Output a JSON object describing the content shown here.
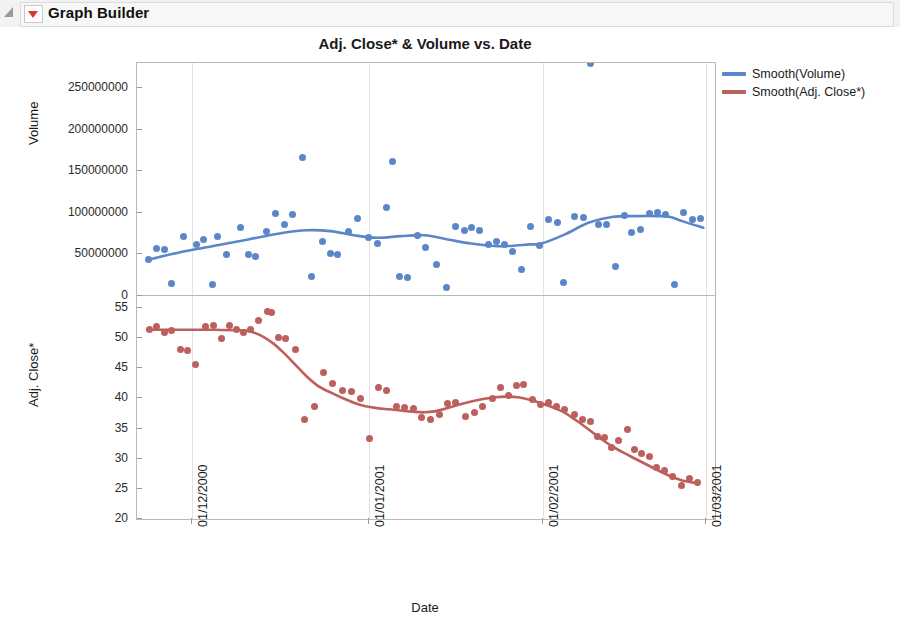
{
  "window": {
    "title": "Graph Builder",
    "disclosure_icon": "triangle-collapse-icon",
    "menu_icon": "red-dropdown-icon"
  },
  "chart_data": {
    "type": "scatter",
    "title": "Adj. Close* & Volume vs. Date",
    "xlabel": "Date",
    "grid": true,
    "legend_position": "right",
    "panels": [
      {
        "name": "volume",
        "ylabel": "Volume",
        "ylim": [
          0,
          280000000
        ],
        "yticks": [
          0,
          50000000,
          100000000,
          150000000,
          200000000,
          250000000
        ],
        "ytick_labels": [
          "0",
          "50000000",
          "100000000",
          "150000000",
          "200000000",
          "250000000"
        ],
        "point_color": "#5b87c9",
        "line_color": "#5b87c9",
        "series_name": "Volume",
        "smooth_name": "Smooth(Volume)",
        "points": [
          [
            0.5,
            44000000
          ],
          [
            1.2,
            57000000
          ],
          [
            1.8,
            56000000
          ],
          [
            2.4,
            15000000
          ],
          [
            3.5,
            72000000
          ],
          [
            4.6,
            62000000
          ],
          [
            5.2,
            68000000
          ],
          [
            5.9,
            14000000
          ],
          [
            6.4,
            72000000
          ],
          [
            7.1,
            50000000
          ],
          [
            8.3,
            82000000
          ],
          [
            9.0,
            50000000
          ],
          [
            9.6,
            47000000
          ],
          [
            10.5,
            77000000
          ],
          [
            11.3,
            99000000
          ],
          [
            12.1,
            86000000
          ],
          [
            12.8,
            98000000
          ],
          [
            13.6,
            167000000
          ],
          [
            14.4,
            23000000
          ],
          [
            15.3,
            66000000
          ],
          [
            16.0,
            51000000
          ],
          [
            16.6,
            50000000
          ],
          [
            17.5,
            78000000
          ],
          [
            18.3,
            93000000
          ],
          [
            19.2,
            70000000
          ],
          [
            20.0,
            63000000
          ],
          [
            20.8,
            107000000
          ],
          [
            21.3,
            162000000
          ],
          [
            21.9,
            24000000
          ],
          [
            22.6,
            22000000
          ],
          [
            23.4,
            73000000
          ],
          [
            24.1,
            58000000
          ],
          [
            25.0,
            38000000
          ],
          [
            25.9,
            10000000
          ],
          [
            26.7,
            83000000
          ],
          [
            27.4,
            79000000
          ],
          [
            28.0,
            82000000
          ],
          [
            28.7,
            79000000
          ],
          [
            29.5,
            62000000
          ],
          [
            30.2,
            66000000
          ],
          [
            30.8,
            62000000
          ],
          [
            31.5,
            54000000
          ],
          [
            32.3,
            32000000
          ],
          [
            33.1,
            84000000
          ],
          [
            33.8,
            61000000
          ],
          [
            34.6,
            92000000
          ],
          [
            35.4,
            88000000
          ],
          [
            35.9,
            16000000
          ],
          [
            36.8,
            95000000
          ],
          [
            37.6,
            94000000
          ],
          [
            38.2,
            280000000
          ],
          [
            38.9,
            86000000
          ],
          [
            39.5,
            86000000
          ],
          [
            40.3,
            36000000
          ],
          [
            41.1,
            97000000
          ],
          [
            41.7,
            76000000
          ],
          [
            42.4,
            80000000
          ],
          [
            43.2,
            99000000
          ],
          [
            43.9,
            101000000
          ],
          [
            44.6,
            98000000
          ],
          [
            45.3,
            14000000
          ],
          [
            46.1,
            100000000
          ],
          [
            46.9,
            92000000
          ],
          [
            47.6,
            93000000
          ]
        ],
        "smooth": [
          [
            0.3,
            43000000
          ],
          [
            3,
            52000000
          ],
          [
            6,
            60000000
          ],
          [
            9,
            68000000
          ],
          [
            12,
            76000000
          ],
          [
            14,
            79000000
          ],
          [
            16,
            78000000
          ],
          [
            18,
            73000000
          ],
          [
            20,
            70000000
          ],
          [
            22,
            72000000
          ],
          [
            24,
            73000000
          ],
          [
            26,
            68000000
          ],
          [
            28,
            63000000
          ],
          [
            30,
            60000000
          ],
          [
            31,
            60000000
          ],
          [
            33,
            62000000
          ],
          [
            34,
            63000000
          ],
          [
            36,
            74000000
          ],
          [
            38,
            88000000
          ],
          [
            40,
            95000000
          ],
          [
            42,
            96000000
          ],
          [
            44,
            96000000
          ],
          [
            45,
            95000000
          ],
          [
            46,
            90000000
          ],
          [
            47.8,
            82000000
          ]
        ]
      },
      {
        "name": "adj_close",
        "ylabel": "Adj. Close*",
        "ylim": [
          20,
          57
        ],
        "yticks": [
          20,
          25,
          30,
          35,
          40,
          45,
          50,
          55
        ],
        "ytick_labels": [
          "20",
          "25",
          "30",
          "35",
          "40",
          "45",
          "50",
          "55"
        ],
        "point_color": "#bd5f5c",
        "line_color": "#bd5f5c",
        "series_name": "Adj. Close*",
        "smooth_name": "Smooth(Adj. Close*)",
        "points": [
          [
            0.6,
            51.4
          ],
          [
            1.2,
            51.9
          ],
          [
            1.8,
            51.0
          ],
          [
            2.4,
            51.3
          ],
          [
            3.2,
            48.1
          ],
          [
            3.8,
            47.9
          ],
          [
            4.5,
            45.6
          ],
          [
            5.3,
            51.9
          ],
          [
            6.0,
            52.1
          ],
          [
            6.7,
            50.0
          ],
          [
            7.4,
            52.1
          ],
          [
            8.0,
            51.5
          ],
          [
            8.6,
            50.9
          ],
          [
            9.2,
            51.5
          ],
          [
            9.9,
            53.0
          ],
          [
            10.6,
            54.5
          ],
          [
            11.0,
            54.3
          ],
          [
            11.6,
            50.2
          ],
          [
            12.2,
            50.0
          ],
          [
            13.0,
            48.1
          ],
          [
            13.8,
            36.5
          ],
          [
            14.6,
            38.7
          ],
          [
            15.4,
            44.3
          ],
          [
            16.2,
            42.5
          ],
          [
            17.0,
            41.4
          ],
          [
            17.8,
            41.1
          ],
          [
            18.6,
            40.0
          ],
          [
            19.3,
            33.4
          ],
          [
            20.1,
            41.8
          ],
          [
            20.8,
            41.4
          ],
          [
            21.6,
            38.7
          ],
          [
            22.3,
            38.5
          ],
          [
            23.1,
            38.4
          ],
          [
            23.8,
            36.8
          ],
          [
            24.5,
            36.6
          ],
          [
            25.3,
            37.3
          ],
          [
            26.0,
            39.1
          ],
          [
            26.7,
            39.4
          ],
          [
            27.5,
            37.0
          ],
          [
            28.3,
            37.6
          ],
          [
            29.0,
            38.6
          ],
          [
            29.8,
            40.0
          ],
          [
            30.5,
            41.9
          ],
          [
            31.2,
            40.5
          ],
          [
            31.9,
            42.2
          ],
          [
            32.5,
            42.4
          ],
          [
            33.2,
            39.9
          ],
          [
            33.9,
            39.0
          ],
          [
            34.6,
            39.4
          ],
          [
            35.3,
            38.6
          ],
          [
            36.0,
            38.2
          ],
          [
            36.8,
            37.4
          ],
          [
            37.5,
            36.6
          ],
          [
            38.2,
            36.2
          ],
          [
            38.8,
            33.7
          ],
          [
            39.4,
            33.5
          ],
          [
            40.0,
            31.9
          ],
          [
            40.6,
            33.0
          ],
          [
            41.3,
            34.8
          ],
          [
            41.9,
            31.5
          ],
          [
            42.5,
            30.9
          ],
          [
            43.2,
            30.3
          ],
          [
            43.8,
            28.5
          ],
          [
            44.5,
            28.0
          ],
          [
            45.2,
            27.0
          ],
          [
            45.9,
            25.6
          ],
          [
            46.6,
            26.8
          ],
          [
            47.3,
            26.0
          ]
        ],
        "smooth": [
          [
            0.4,
            51.4
          ],
          [
            3,
            51.4
          ],
          [
            6,
            51.4
          ],
          [
            8,
            51.3
          ],
          [
            9,
            51.2
          ],
          [
            10,
            50.5
          ],
          [
            11,
            49.3
          ],
          [
            12,
            47.6
          ],
          [
            13,
            45.6
          ],
          [
            14,
            43.6
          ],
          [
            15,
            42.0
          ],
          [
            16,
            41.0
          ],
          [
            17,
            40.1
          ],
          [
            18,
            39.3
          ],
          [
            19,
            38.7
          ],
          [
            20,
            38.4
          ],
          [
            21,
            38.2
          ],
          [
            22,
            38.0
          ],
          [
            23,
            37.8
          ],
          [
            24,
            37.7
          ],
          [
            25,
            37.9
          ],
          [
            26,
            38.4
          ],
          [
            27,
            39.0
          ],
          [
            28,
            39.5
          ],
          [
            29,
            39.9
          ],
          [
            30,
            40.2
          ],
          [
            31,
            40.3
          ],
          [
            32,
            40.2
          ],
          [
            33,
            39.8
          ],
          [
            34,
            39.2
          ],
          [
            35,
            38.5
          ],
          [
            36,
            37.6
          ],
          [
            37,
            36.3
          ],
          [
            38,
            34.9
          ],
          [
            39,
            33.4
          ],
          [
            40,
            32.1
          ],
          [
            41,
            31.0
          ],
          [
            42,
            30.0
          ],
          [
            43,
            29.0
          ],
          [
            44,
            28.0
          ],
          [
            45,
            27.1
          ],
          [
            46,
            26.4
          ],
          [
            47.4,
            25.9
          ]
        ]
      }
    ],
    "xticks": [
      {
        "label": "01/12/2000",
        "value": 4.2
      },
      {
        "label": "01/01/2001",
        "value": 19.3
      },
      {
        "label": "01/02/2001",
        "value": 34.1
      },
      {
        "label": "01/03/2001",
        "value": 48.0
      }
    ],
    "xlim": [
      -0.5,
      48.8
    ],
    "legend": [
      {
        "label": "Smooth(Volume)",
        "color": "#5b87c9"
      },
      {
        "label": "Smooth(Adj. Close*)",
        "color": "#bd5f5c"
      }
    ]
  }
}
